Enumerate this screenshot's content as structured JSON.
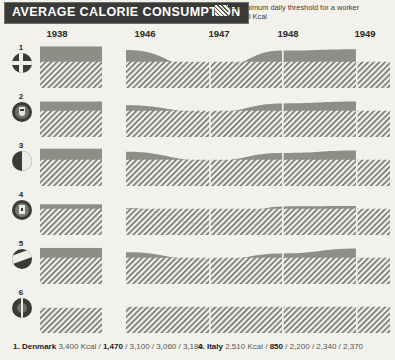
{
  "header": {
    "title": "AVERAGE CALORIE CONSUMPTION",
    "legend": {
      "icon": "hatch-swatch",
      "line1": "= minimum daily threshold for a worker",
      "line2": "2,150 Kcal"
    }
  },
  "axis": {
    "years": [
      "1938",
      "1946",
      "1947",
      "1948",
      "1949"
    ],
    "year_x": [
      57,
      145,
      219,
      288,
      365
    ]
  },
  "chart_data": {
    "type": "area",
    "title": "AVERAGE CALORIE CONSUMPTION",
    "xlabel": "",
    "ylabel": "Kcal",
    "categories": [
      "1938",
      "1946",
      "1947",
      "1948",
      "1949"
    ],
    "threshold": 2150,
    "threshold_label": "minimum daily threshold for a worker 2,150 Kcal",
    "ylim": [
      0,
      3600
    ],
    "grid": false,
    "legend_position": "top-right",
    "series": [
      {
        "index": "1",
        "name": "Denmark",
        "icon": "flag-denmark-cross",
        "values": [
          3400,
          3100,
          1470,
          3060,
          3180
        ],
        "label_values": [
          "3,400 Kcal",
          "1,470",
          "3,100",
          "3,060",
          "3,180"
        ]
      },
      {
        "index": "2",
        "name": "",
        "icon": "flag-crest",
        "values": [
          2900,
          2600,
          2000,
          2750,
          2900
        ],
        "label_values": []
      },
      {
        "index": "3",
        "name": "",
        "icon": "flag-vertical-bicolor",
        "values": [
          3050,
          2800,
          2050,
          2700,
          2900
        ],
        "label_values": []
      },
      {
        "index": "4",
        "name": "Italy",
        "icon": "flag-crest-square",
        "values": [
          2510,
          2200,
          850,
          2340,
          2370
        ],
        "label_values": [
          "2,510 Kcal",
          "850",
          "2,200",
          "2,340",
          "2,370"
        ]
      },
      {
        "index": "5",
        "name": "",
        "icon": "flag-diagonal",
        "values": [
          2950,
          2600,
          1900,
          2500,
          2900
        ],
        "label_values": []
      },
      {
        "index": "6",
        "name": "",
        "icon": "flag-sunburst",
        "values": [
          2050,
          2000,
          1980,
          2000,
          2020
        ],
        "label_values": []
      }
    ]
  },
  "caption": {
    "entries": [
      {
        "index": "1.",
        "name": "Denmark",
        "values": "3,400 Kcal / ",
        "low": "1,470",
        "rest": " / 3,100 / 3,060 / 3,180"
      },
      {
        "index": "4.",
        "name": "Italy",
        "values": "2,510 Kcal / ",
        "low": "850",
        "rest": " / 2,200 / 2,340 / 2,370"
      }
    ]
  }
}
